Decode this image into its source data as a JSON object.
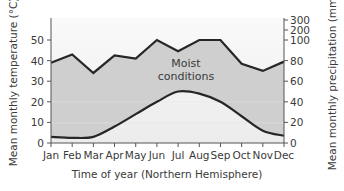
{
  "chart_data": {
    "type": "line",
    "title": "",
    "xlabel": "Time of year (Northern Hemisphere)",
    "ylabel_left": "Mean monthly temperature (°C)",
    "ylabel_right": "Mean monthly precipitation (mm)",
    "categories": [
      "Jan",
      "Feb",
      "Mar",
      "Apr",
      "May",
      "Jun",
      "Jul",
      "Aug",
      "Sep",
      "Oct",
      "Nov",
      "Dec"
    ],
    "left_axis": {
      "ticks": [
        0,
        10,
        20,
        30,
        40,
        50
      ],
      "ylim": [
        0,
        60
      ]
    },
    "right_axis": {
      "ticks": [
        "0",
        "20",
        "40",
        "60",
        "80",
        "100",
        "200",
        "300"
      ],
      "note": "scale compressed above 100"
    },
    "series": [
      {
        "name": "Precipitation",
        "axis": "right",
        "values": [
          78,
          86,
          68,
          85,
          82,
          100,
          89,
          100,
          100,
          77,
          70,
          79
        ]
      },
      {
        "name": "Temperature",
        "axis": "left",
        "values": [
          3,
          2.5,
          3,
          8,
          14,
          20,
          25,
          24,
          20,
          13,
          6,
          3.5
        ]
      }
    ],
    "annotations": [
      {
        "text_line1": "Moist",
        "text_line2": "conditions"
      }
    ],
    "grid": false,
    "legend": "none"
  },
  "colors": {
    "moist_fill": "#cfcfcf",
    "background_top": "#f4f4f4",
    "line": "#262626",
    "axis": "#555555",
    "text": "#3a3a3a"
  }
}
